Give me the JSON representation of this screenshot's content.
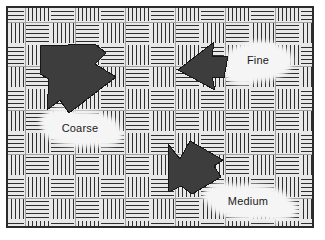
{
  "figure": {
    "kind": "texture-diagram",
    "canvas": {
      "width": 325,
      "height": 240
    },
    "background_color": "#ffffff"
  },
  "frame": {
    "name": "image-border",
    "x": 6,
    "y": 6,
    "width": 308,
    "height": 222,
    "stroke_color": "#2b2b2b",
    "stroke_width": 2,
    "fill_color": "#ededed"
  },
  "pattern": {
    "name": "basketweave-hatch",
    "description": "Parquet / basket-weave fill of alternating horizontally and vertically line-hatched square blocks",
    "block_width": 25,
    "block_height": 22,
    "line_color": "#2e2e2e",
    "line_width": 1,
    "line_spacing": 4,
    "fill_color": "#e8e8e8",
    "block_outline_color": "#6b6b6b"
  },
  "arrows": [
    {
      "id": "arrow-coarse",
      "label_ref": "Coarse",
      "direction": "right",
      "size": "large",
      "fill_color": "#3d3d3d",
      "stroke_color": "#1a1a1a",
      "points": "41,46 95,44 106,53 95,64 116,77 69,113 60,100 47,110 49,79 40,74"
    },
    {
      "id": "arrow-fine",
      "label_ref": "Fine",
      "direction": "left",
      "size": "medium",
      "fill_color": "#3d3d3d",
      "stroke_color": "#1a1a1a",
      "points": "178,70 214,42 212,57 228,56 224,78 212,77 215,90"
    },
    {
      "id": "arrow-medium",
      "label_ref": "Medium",
      "direction": "right",
      "size": "medium",
      "fill_color": "#3d3d3d",
      "stroke_color": "#1a1a1a",
      "points": "168,144 180,159 190,141 223,160 214,166 221,177 192,194 181,186 169,192"
    }
  ],
  "labels": [
    {
      "id": "label-coarse",
      "text": "Coarse",
      "x": 80,
      "y": 132,
      "patch": {
        "cx": 81,
        "cy": 129,
        "rx": 37,
        "ry": 17,
        "fill": "#f4f4f4"
      }
    },
    {
      "id": "label-fine",
      "text": "Fine",
      "x": 258,
      "y": 64,
      "patch": {
        "cx": 258,
        "cy": 61,
        "rx": 32,
        "ry": 19,
        "fill": "#f4f4f4"
      }
    },
    {
      "id": "label-medium",
      "text": "Medium",
      "x": 248,
      "y": 205,
      "patch": {
        "cx": 248,
        "cy": 202,
        "rx": 40,
        "ry": 17,
        "fill": "#f4f4f4"
      }
    }
  ]
}
